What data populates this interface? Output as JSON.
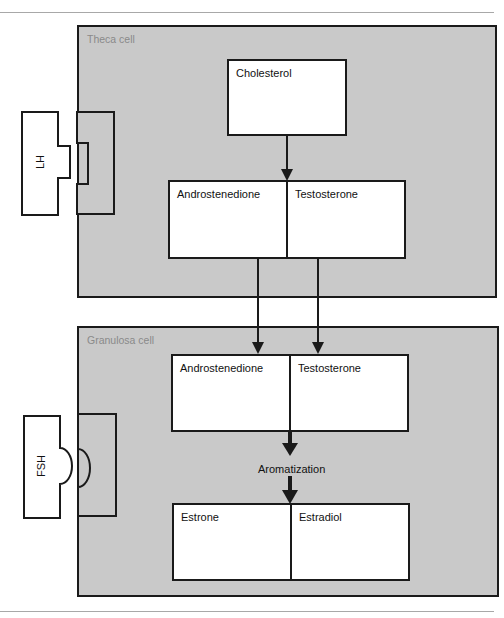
{
  "diagram": {
    "title": "",
    "cells": {
      "theca": {
        "label": "Theca cell",
        "hormone": "LH",
        "nodes": {
          "cholesterol": "Cholesterol",
          "androstenedione": "Androstenedione",
          "testosterone": "Testosterone"
        }
      },
      "granulosa": {
        "label": "Granulosa cell",
        "hormone": "FSH",
        "nodes": {
          "androstenedione": "Androstenedione",
          "testosterone": "Testosterone",
          "process": "Aromatization",
          "estrone": "Estrone",
          "estradiol": "Estradiol"
        }
      }
    },
    "edges": [
      {
        "from": "Cholesterol",
        "to": "Androstenedione/Testosterone (theca)"
      },
      {
        "from": "Androstenedione (theca)",
        "to": "Androstenedione (granulosa)"
      },
      {
        "from": "Testosterone (theca)",
        "to": "Testosterone (granulosa)"
      },
      {
        "from": "Androstenedione/Testosterone (granulosa)",
        "to": "Aromatization"
      },
      {
        "from": "Aromatization",
        "to": "Estrone/Estradiol"
      }
    ],
    "colors": {
      "cell_fill": "#c9c9c9",
      "node_fill": "#ffffff",
      "stroke": "#1a1a1a",
      "cell_label": "#8a8a8a"
    }
  }
}
